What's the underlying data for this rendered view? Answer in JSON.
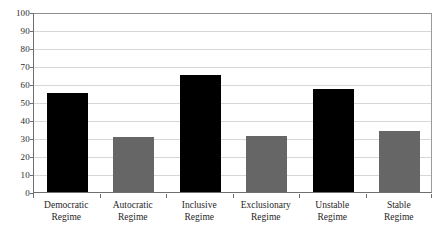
{
  "chart_data": {
    "type": "bar",
    "title": "",
    "subtitle": "",
    "xlabel": "",
    "ylabel": "",
    "categories": [
      "Democratic Regime",
      "Autocratic Regime",
      "Inclusive Regime",
      "Exclusionary Regime",
      "Unstable Regime",
      "Stable Regime"
    ],
    "category_lines": [
      [
        "Democratic",
        "Regime"
      ],
      [
        "Autocratic",
        "Regime"
      ],
      [
        "Inclusive",
        "Regime"
      ],
      [
        "Exclusionary",
        "Regime"
      ],
      [
        "Unstable",
        "Regime"
      ],
      [
        "Stable",
        "Regime"
      ]
    ],
    "values": [
      55,
      30.5,
      65,
      31,
      57.5,
      34
    ],
    "bar_colors": [
      "#000000",
      "#666666",
      "#000000",
      "#666666",
      "#000000",
      "#666666"
    ],
    "ylim": [
      0,
      100
    ],
    "ytick_values": [
      0,
      10,
      20,
      30,
      40,
      50,
      60,
      70,
      80,
      90,
      100
    ],
    "ytick_labels": [
      "0",
      "10",
      "20",
      "30",
      "40",
      "50",
      "60",
      "70",
      "80",
      "90",
      "100"
    ],
    "grid": true,
    "grid_axis": "y",
    "legend": false,
    "legend_position": "none",
    "axis_color": "#6e6e6e",
    "grid_color": "#d7d7d7",
    "background_color": "#ffffff"
  }
}
